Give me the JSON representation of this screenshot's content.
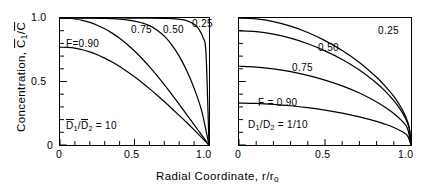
{
  "figure": {
    "ylabel_parts": {
      "pre": "Concentration, ",
      "c1": "C",
      "sub1": "1",
      "slash": "/",
      "c2": "C"
    },
    "xlabel_parts": {
      "pre": "Radial Coordinate, r/r",
      "sub": "o"
    }
  },
  "axes": {
    "y": {
      "labels": [
        "1.0",
        "0.5",
        "0"
      ],
      "values": [
        1.0,
        0.5,
        0.0
      ],
      "range": [
        0,
        1
      ],
      "minor_ticks": 10
    },
    "x": {
      "labels": [
        "0",
        "0.5",
        "1.0"
      ],
      "values": [
        0.0,
        0.5,
        1.0
      ],
      "range": [
        0,
        1
      ],
      "minor_ticks": 10
    }
  },
  "panels": {
    "left": {
      "ratio_text": {
        "d": "D",
        "s1": "1",
        "slash": "/",
        "d2": "D",
        "s2": "2",
        "eq": " = 10"
      },
      "f_label": "F=0.90",
      "curve_labels": [
        "0.75",
        "0.50",
        "0.25"
      ]
    },
    "right": {
      "ratio_text": {
        "d": "D",
        "s1": "1",
        "slash": "/",
        "d2": "D",
        "s2": "2",
        "eq": " = 1/10"
      },
      "f_label": "F = 0.90",
      "curve_labels": [
        "0.75",
        "0.50",
        "0.25"
      ]
    }
  },
  "chart_data": {
    "type": "line",
    "title": "",
    "xlabel": "Radial Coordinate, r/r_o",
    "ylabel": "Concentration, C̄1/C̄",
    "xlim": [
      0,
      1
    ],
    "ylim": [
      0,
      1
    ],
    "grid": false,
    "legend": "inline-curve-labels",
    "subplots": [
      {
        "name": "left",
        "annotation": "D̄1/D̄2 = 10",
        "series": [
          {
            "name": "F=0.90",
            "x": [
              0,
              0.05,
              0.1,
              0.15,
              0.2,
              0.25,
              0.3,
              0.35,
              0.4,
              0.45,
              0.5,
              0.55,
              0.6,
              0.65,
              0.7,
              0.75,
              0.8,
              0.85,
              0.9,
              0.95,
              1.0
            ],
            "y": [
              0.77,
              0.768,
              0.762,
              0.75,
              0.733,
              0.711,
              0.684,
              0.653,
              0.618,
              0.579,
              0.537,
              0.492,
              0.444,
              0.394,
              0.342,
              0.288,
              0.233,
              0.177,
              0.119,
              0.06,
              0.0
            ]
          },
          {
            "name": "0.75",
            "x": [
              0,
              0.05,
              0.1,
              0.15,
              0.2,
              0.25,
              0.3,
              0.35,
              0.4,
              0.45,
              0.5,
              0.55,
              0.6,
              0.65,
              0.7,
              0.75,
              0.8,
              0.85,
              0.9,
              0.95,
              1.0
            ],
            "y": [
              1.0,
              0.998,
              0.992,
              0.981,
              0.965,
              0.943,
              0.915,
              0.881,
              0.84,
              0.793,
              0.74,
              0.681,
              0.617,
              0.548,
              0.475,
              0.399,
              0.32,
              0.24,
              0.16,
              0.08,
              0.0
            ]
          },
          {
            "name": "0.50",
            "x": [
              0,
              0.1,
              0.2,
              0.3,
              0.4,
              0.5,
              0.55,
              0.6,
              0.65,
              0.7,
              0.75,
              0.8,
              0.85,
              0.9,
              0.95,
              1.0
            ],
            "y": [
              1.0,
              1.0,
              0.999,
              0.997,
              0.991,
              0.976,
              0.962,
              0.94,
              0.906,
              0.857,
              0.789,
              0.7,
              0.586,
              0.447,
              0.272,
              0.0
            ]
          },
          {
            "name": "0.25",
            "x": [
              0,
              0.2,
              0.4,
              0.6,
              0.7,
              0.75,
              0.8,
              0.85,
              0.9,
              0.93,
              0.96,
              0.98,
              1.0
            ],
            "y": [
              1.0,
              1.0,
              1.0,
              0.999,
              0.997,
              0.995,
              0.99,
              0.979,
              0.95,
              0.916,
              0.845,
              0.72,
              0.0
            ]
          }
        ]
      },
      {
        "name": "right",
        "annotation": "D1/D2 = 1/10",
        "series": [
          {
            "name": "F=0.90",
            "x": [
              0,
              0.1,
              0.2,
              0.3,
              0.4,
              0.5,
              0.6,
              0.7,
              0.8,
              0.85,
              0.9,
              0.95,
              0.98,
              1.0
            ],
            "y": [
              0.33,
              0.327,
              0.32,
              0.309,
              0.294,
              0.275,
              0.251,
              0.222,
              0.186,
              0.164,
              0.138,
              0.104,
              0.072,
              0.0
            ]
          },
          {
            "name": "0.75",
            "x": [
              0,
              0.1,
              0.2,
              0.3,
              0.4,
              0.5,
              0.6,
              0.7,
              0.8,
              0.85,
              0.9,
              0.95,
              0.98,
              1.0
            ],
            "y": [
              0.62,
              0.614,
              0.6,
              0.578,
              0.548,
              0.511,
              0.465,
              0.409,
              0.339,
              0.297,
              0.248,
              0.186,
              0.13,
              0.0
            ]
          },
          {
            "name": "0.50",
            "x": [
              0,
              0.1,
              0.2,
              0.3,
              0.4,
              0.5,
              0.6,
              0.7,
              0.8,
              0.85,
              0.9,
              0.94,
              0.97,
              0.99,
              1.0
            ],
            "y": [
              0.9,
              0.893,
              0.873,
              0.841,
              0.797,
              0.741,
              0.673,
              0.59,
              0.487,
              0.424,
              0.35,
              0.277,
              0.204,
              0.128,
              0.0
            ]
          },
          {
            "name": "0.25",
            "x": [
              0,
              0.1,
              0.2,
              0.3,
              0.4,
              0.5,
              0.6,
              0.7,
              0.8,
              0.85,
              0.9,
              0.94,
              0.97,
              0.99,
              1.0
            ],
            "y": [
              1.0,
              0.993,
              0.972,
              0.936,
              0.886,
              0.822,
              0.744,
              0.65,
              0.533,
              0.463,
              0.382,
              0.301,
              0.22,
              0.135,
              0.0
            ]
          }
        ]
      }
    ]
  }
}
